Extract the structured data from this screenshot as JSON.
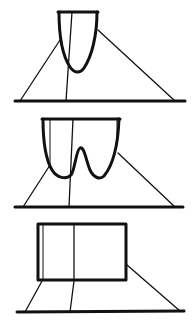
{
  "diagram": {
    "type": "line-drawing",
    "stroke_color": "#111111",
    "background": "#ffffff",
    "figures": [
      {
        "id": "figure-1",
        "description": "Single-lobe rounded cup (U-shape) viewed in perspective, with converging lines to a ground line",
        "shape": "u-cup"
      },
      {
        "id": "figure-2",
        "description": "Double-lobe cup (W-shape) viewed in perspective, with converging lines to a ground line",
        "shape": "w-cup"
      },
      {
        "id": "figure-3",
        "description": "Rectangular box viewed in perspective, with converging lines to a ground line",
        "shape": "rectangle"
      }
    ]
  }
}
